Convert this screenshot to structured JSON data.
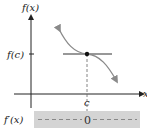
{
  "diagram": {
    "y_axis_label": "f(x)",
    "x_axis_label": "x",
    "y_tick_label": "f(c)",
    "x_tick_label": "c",
    "sign_chart": {
      "label": "f′(x)",
      "value_at_c": "0"
    }
  },
  "colors": {
    "axis": "#222222",
    "curve": "#8a8a8a",
    "tangent": "#333333",
    "band": "#d4d4d4",
    "dashes": "#888888"
  }
}
